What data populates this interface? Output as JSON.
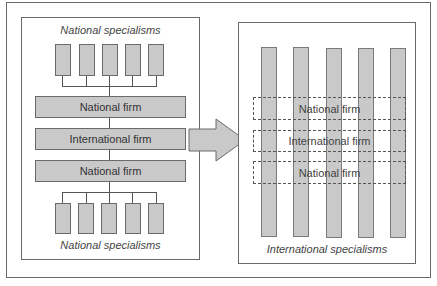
{
  "left_panel": {
    "top_caption": "National specialisms",
    "bottom_caption": "National specialisms",
    "firms": [
      {
        "label": "National firm"
      },
      {
        "label": "International firm"
      },
      {
        "label": "National firm"
      }
    ],
    "top_specialisms_count": 5,
    "bottom_specialisms_count": 5
  },
  "arrow": {
    "direction": "right",
    "meaning": "transition"
  },
  "right_panel": {
    "bottom_caption": "International specialisms",
    "columns_count": 5,
    "firms": [
      {
        "label": "National firm"
      },
      {
        "label": "International firm"
      },
      {
        "label": "National firm"
      }
    ]
  },
  "colors": {
    "fill": "#c9c9c9",
    "stroke": "#6a6a6a",
    "background": "#ffffff"
  }
}
